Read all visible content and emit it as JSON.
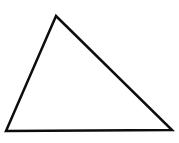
{
  "canvas": {
    "width": 179,
    "height": 143,
    "background_color": "#ffffff"
  },
  "shape": {
    "type": "triangle",
    "description": "scalene triangle outline",
    "stroke_color": "#0d0d0d",
    "stroke_width": 2.5,
    "fill": "none",
    "vertices": [
      {
        "name": "apex",
        "x": 56,
        "y": 16
      },
      {
        "name": "bottom-left",
        "x": 6,
        "y": 131
      },
      {
        "name": "bottom-right",
        "x": 172,
        "y": 130
      }
    ]
  }
}
